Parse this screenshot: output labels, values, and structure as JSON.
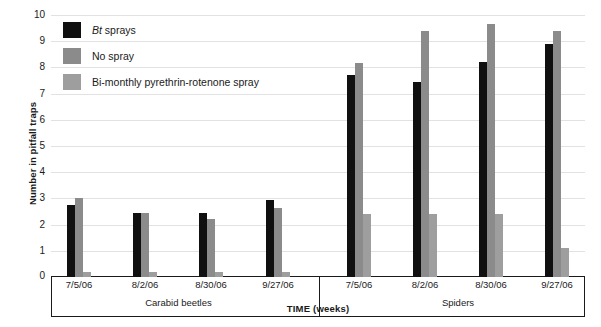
{
  "chart_data": {
    "type": "bar",
    "title": "",
    "xlabel": "TIME (weeks)",
    "ylabel": "Number in pitfall traps",
    "ylim": [
      0,
      10
    ],
    "ytick_step": 1,
    "yticks": [
      "10",
      "9",
      "8",
      "7",
      "6",
      "5",
      "4",
      "3",
      "2",
      "1",
      "0"
    ],
    "grid": true,
    "legend_position": "top-left",
    "groups": [
      {
        "name": "Carabid beetles",
        "categories": [
          "7/5/06",
          "8/2/06",
          "8/30/06",
          "9/27/06"
        ]
      },
      {
        "name": "Spiders",
        "categories": [
          "7/5/06",
          "8/2/06",
          "8/30/06",
          "9/27/06"
        ]
      }
    ],
    "categories": [
      "7/5/06",
      "8/2/06",
      "8/30/06",
      "9/27/06",
      "7/5/06",
      "8/2/06",
      "8/30/06",
      "9/27/06"
    ],
    "series": [
      {
        "name": "Bt sprays",
        "name_italic_prefix": "Bt",
        "name_rest": " sprays",
        "color": "#101010",
        "values": [
          2.75,
          2.45,
          2.45,
          2.95,
          7.7,
          7.45,
          8.2,
          8.9
        ]
      },
      {
        "name": "No spray",
        "color": "#8b8b8b",
        "values": [
          3.0,
          2.45,
          2.2,
          2.65,
          8.15,
          9.4,
          9.65,
          9.4
        ]
      },
      {
        "name": "Bi-monthly pyrethrin-rotenone spray",
        "color": "#9e9e9e",
        "values": [
          0.2,
          0.2,
          0.2,
          0.2,
          2.4,
          2.4,
          2.4,
          1.1
        ]
      }
    ]
  }
}
